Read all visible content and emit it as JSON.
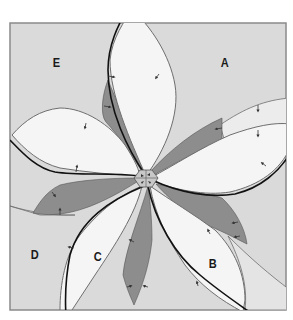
{
  "diagram": {
    "type": "rosette-of-overlapping-lobes",
    "colors": {
      "frame_fill": "#dadada",
      "frame_border": "#8a8a8a",
      "petal_fill": "#f5f5f5",
      "overlap_fill": "#8d8d8d",
      "thin_line": "#6e6e6e",
      "thick_line": "#111111",
      "center_fill": "#c8c8c8"
    },
    "regions": [
      {
        "id": "A",
        "label": "A",
        "x": 220,
        "y": 55
      },
      {
        "id": "B",
        "label": "B",
        "x": 208,
        "y": 256
      },
      {
        "id": "C",
        "label": "C",
        "x": 93,
        "y": 249
      },
      {
        "id": "D",
        "label": "D",
        "x": 30,
        "y": 247
      },
      {
        "id": "E",
        "label": "E",
        "x": 52,
        "y": 55
      }
    ],
    "center": {
      "x": 146,
      "y": 178,
      "shape": "hexagon"
    }
  }
}
